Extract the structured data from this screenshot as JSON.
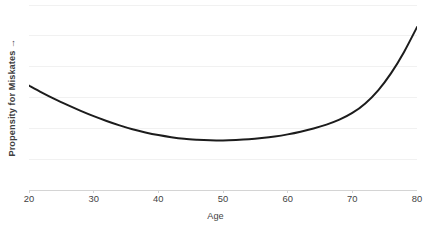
{
  "chart_data": {
    "type": "line",
    "title": "",
    "subtitle": "",
    "xlabel": "Age",
    "ylabel": "Propensity for Miskates →",
    "xlim": [
      20,
      80
    ],
    "ylim": [
      0,
      1
    ],
    "xticks": [
      20,
      30,
      40,
      50,
      60,
      70,
      80
    ],
    "xtick_labels": [
      "20",
      "30",
      "40",
      "50",
      "60",
      "70",
      "80"
    ],
    "ytick_labels": [],
    "grid": {
      "horizontal": true,
      "vertical": false,
      "count": 7,
      "color": "#f1f1f1"
    },
    "legend": {
      "visible": false,
      "position": "none",
      "entries": []
    },
    "annotations": [],
    "series": [
      {
        "name": "Propensity for Miskates",
        "color": "#1c1c1c",
        "width": 2,
        "x": [
          20,
          22,
          24,
          26,
          28,
          30,
          32,
          34,
          36,
          38,
          40,
          42,
          44,
          46,
          48,
          50,
          52,
          54,
          56,
          58,
          60,
          62,
          64,
          66,
          68,
          70,
          72,
          74,
          76,
          78,
          80
        ],
        "y": [
          0.545,
          0.505,
          0.468,
          0.434,
          0.402,
          0.372,
          0.345,
          0.32,
          0.298,
          0.28,
          0.265,
          0.253,
          0.244,
          0.239,
          0.236,
          0.235,
          0.237,
          0.241,
          0.248,
          0.257,
          0.269,
          0.284,
          0.302,
          0.324,
          0.352,
          0.39,
          0.444,
          0.518,
          0.615,
          0.735,
          0.875
        ]
      }
    ]
  },
  "axes": {
    "axis_line_color": "#d4d4d4",
    "tick_color": "#d4d4d4",
    "text_color": "#3f3f3f"
  },
  "canvas": {
    "background": "#ffffff",
    "plot_left": 29,
    "plot_top": 4,
    "plot_width": 388,
    "plot_height": 187
  }
}
